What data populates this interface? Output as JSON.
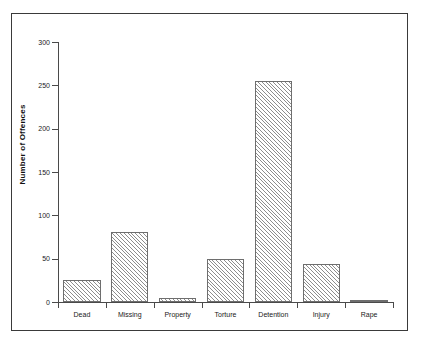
{
  "chart_data": {
    "type": "bar",
    "title": "",
    "subtitle": "",
    "xlabel": "",
    "ylabel": "Number of Offences",
    "categories": [
      "Dead",
      "Missing",
      "Property",
      "Torture",
      "Detention",
      "Injury",
      "Rape"
    ],
    "values": [
      25,
      81,
      5,
      50,
      255,
      44,
      2
    ],
    "ylim": [
      0,
      300
    ],
    "yticks": [
      0,
      50,
      100,
      150,
      200,
      250,
      300
    ],
    "ytick_labels": [
      "0",
      "50",
      "100",
      "150",
      "200",
      "250",
      "300"
    ],
    "grid": false,
    "legend": null,
    "bar_style": {
      "fill": "diagonal-hatch",
      "hatch_color": "#8d8d8d",
      "edge_color": "#6e6e6e",
      "face_color": "#ffffff"
    },
    "frame": {
      "border_color": "#3a3a3a",
      "background": "#ffffff"
    }
  }
}
